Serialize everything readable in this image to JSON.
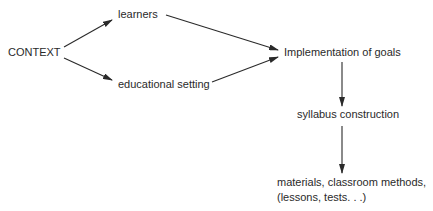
{
  "diagram": {
    "nodes": {
      "context": "CONTEXT",
      "learners": "learners",
      "educational_setting": "educational setting",
      "implementation": "Implementation of goals",
      "syllabus": "syllabus construction",
      "materials_line1": "materials, classroom methods,",
      "materials_line2": "(lessons, tests. . .)"
    },
    "edges": [
      {
        "from": "CONTEXT",
        "to": "learners"
      },
      {
        "from": "CONTEXT",
        "to": "educational setting"
      },
      {
        "from": "learners",
        "to": "Implementation of goals"
      },
      {
        "from": "educational setting",
        "to": "Implementation of goals"
      },
      {
        "from": "Implementation of goals",
        "to": "syllabus construction"
      },
      {
        "from": "syllabus construction",
        "to": "materials, classroom methods, (lessons, tests. . .)"
      }
    ],
    "colors": {
      "line": "#2a2a2a",
      "text": "#2a2a2a",
      "background": "#ffffff"
    }
  }
}
